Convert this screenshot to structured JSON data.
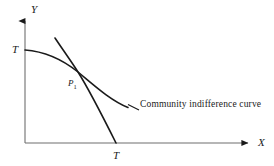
{
  "figure": {
    "background_color": "#ffffff",
    "ink_color": "#1a1a1a",
    "width": 274,
    "height": 166
  },
  "axes": {
    "y": {
      "label": "Y",
      "icon": "arrow-up-icon",
      "origin": [
        25,
        143
      ],
      "tip": [
        25,
        18
      ]
    },
    "x": {
      "label": "X",
      "icon": "arrow-right-icon",
      "origin": [
        25,
        143
      ],
      "tip": [
        252,
        143
      ]
    }
  },
  "tick_labels": {
    "y_intercept": "T",
    "x_intercept": "T"
  },
  "points": {
    "tangency": {
      "label": "P",
      "subscript": "1",
      "coords": [
        78,
        72
      ]
    }
  },
  "curves": [
    {
      "name": "community-indifference-curve",
      "caption": "Community indifference curve",
      "start": [
        25,
        50
      ],
      "end": [
        128,
        108
      ]
    },
    {
      "name": "transformation-curve",
      "caption": "",
      "start": [
        55,
        38
      ],
      "end": [
        116,
        143
      ]
    }
  ],
  "leader_line": {
    "name": "caption-leader-line",
    "from": [
      128,
      104
    ],
    "to": [
      139,
      110
    ]
  }
}
